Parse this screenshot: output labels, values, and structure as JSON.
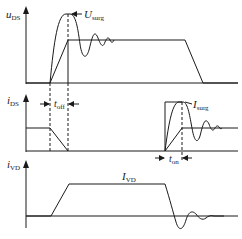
{
  "diagram": {
    "type": "switching-waveforms",
    "panels": [
      {
        "id": "uDS",
        "axis_label": {
          "main": "u",
          "sub": "DS"
        },
        "annotations": [
          {
            "id": "U_surg",
            "main": "U",
            "sub": "surg",
            "points_to": "voltage overshoot peak at turn-off"
          }
        ]
      },
      {
        "id": "iDS",
        "axis_label": {
          "main": "i",
          "sub": "DS"
        },
        "annotations": [
          {
            "id": "t_off",
            "main": "t",
            "sub": "off",
            "meaning": "turn-off interval"
          },
          {
            "id": "I_surg",
            "main": "I",
            "sub": "surg",
            "points_to": "current overshoot peak at turn-on"
          },
          {
            "id": "t_on",
            "main": "t",
            "sub": "on",
            "meaning": "turn-on interval"
          }
        ]
      },
      {
        "id": "iVD",
        "axis_label": {
          "main": "i",
          "sub": "VD"
        },
        "annotations": [
          {
            "id": "I_VD",
            "main": "I",
            "sub": "VD",
            "points_to": "diode current plateau"
          }
        ]
      }
    ],
    "colors": {
      "line": "#1a1a1a",
      "background": "#ffffff"
    }
  }
}
